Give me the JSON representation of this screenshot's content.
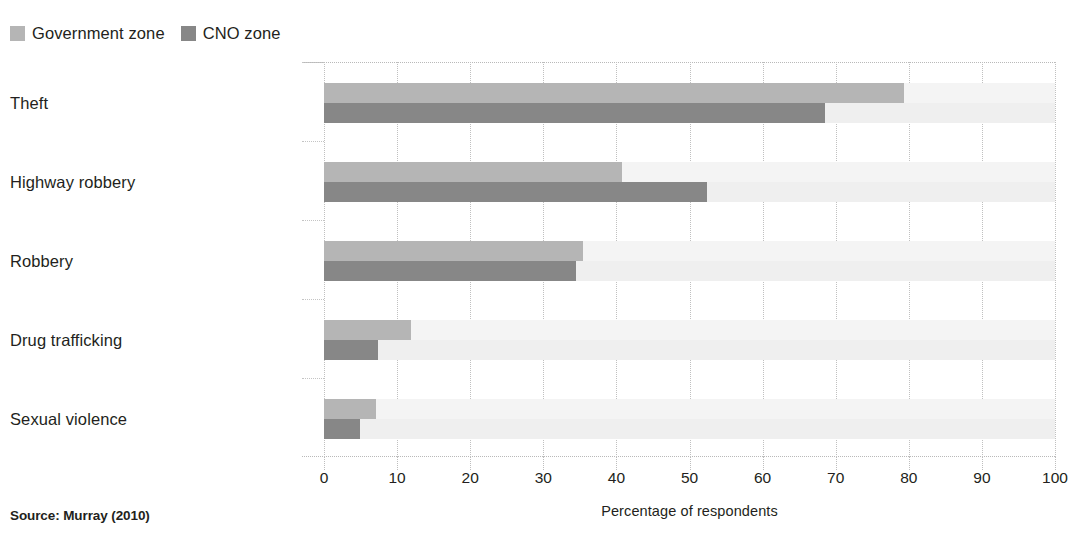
{
  "legend": {
    "position": "top-left",
    "entries": [
      {
        "label": "Government zone",
        "color": "#b5b5b5",
        "swatch_name": "legend-swatch-government-zone"
      },
      {
        "label": "CNO zone",
        "color": "#878787",
        "swatch_name": "legend-swatch-cno-zone"
      }
    ]
  },
  "source_note": "Source: Murray (2010)",
  "chart_data": {
    "type": "bar",
    "orientation": "horizontal",
    "title": "",
    "subtitle": "",
    "xlabel": "Percentage of respondents",
    "ylabel": "",
    "categories": [
      "Theft",
      "Highway robbery",
      "Robbery",
      "Drug trafficking",
      "Sexual violence"
    ],
    "series": [
      {
        "name": "Government zone",
        "color": "#b5b5b5",
        "values": [
          79.3,
          40.8,
          35.4,
          11.9,
          7.1
        ]
      },
      {
        "name": "CNO zone",
        "color": "#878787",
        "values": [
          68.5,
          52.4,
          34.5,
          7.4,
          4.9
        ]
      }
    ],
    "xlim": [
      0,
      100
    ],
    "xticks": [
      0,
      10,
      20,
      30,
      40,
      50,
      60,
      70,
      80,
      90,
      100
    ],
    "xticklabels": [
      "0",
      "10",
      "20",
      "30",
      "40",
      "50",
      "60",
      "70",
      "80",
      "90",
      "100"
    ],
    "grid": "vertical-dotted",
    "legend_position": "top-left",
    "row_band_colors": [
      "#f4f4f4",
      "#efefef"
    ]
  }
}
